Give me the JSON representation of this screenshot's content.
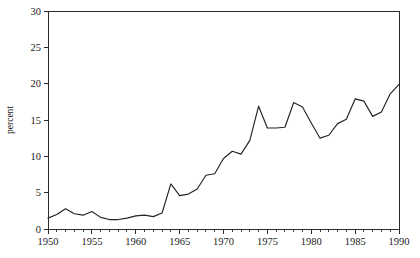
{
  "chart_data": {
    "type": "line",
    "title": "",
    "subtitle": "",
    "xlabel": "",
    "ylabel": "percent",
    "xlim": [
      1950,
      1990
    ],
    "ylim": [
      0,
      30
    ],
    "grid": false,
    "legend": null,
    "x_tick_labels": [
      "1950",
      "1955",
      "1960",
      "1965",
      "1970",
      "1975",
      "1980",
      "1985",
      "1990"
    ],
    "x_tick_values": [
      1950,
      1955,
      1960,
      1965,
      1970,
      1975,
      1980,
      1985,
      1990
    ],
    "x_minor_tick_step": 1,
    "y_tick_labels": [
      "0",
      "5",
      "10",
      "15",
      "20",
      "25",
      "30"
    ],
    "y_tick_values": [
      0,
      5,
      10,
      15,
      20,
      25,
      30
    ],
    "x": [
      1950,
      1951,
      1952,
      1953,
      1954,
      1955,
      1956,
      1957,
      1958,
      1959,
      1960,
      1961,
      1962,
      1963,
      1964,
      1965,
      1966,
      1967,
      1968,
      1969,
      1970,
      1971,
      1972,
      1973,
      1974,
      1975,
      1976,
      1977,
      1978,
      1979,
      1980,
      1981,
      1982,
      1983,
      1984,
      1985,
      1986,
      1987,
      1988,
      1989,
      1990
    ],
    "series": [
      {
        "name": "percent",
        "values": [
          1.5,
          2.0,
          2.8,
          2.1,
          1.9,
          2.4,
          1.6,
          1.3,
          1.3,
          1.5,
          1.8,
          1.9,
          1.7,
          2.2,
          6.2,
          4.6,
          4.8,
          5.5,
          7.4,
          7.6,
          9.7,
          10.7,
          10.3,
          12.2,
          16.9,
          13.9,
          13.9,
          14.0,
          17.4,
          16.8,
          14.6,
          12.5,
          12.9,
          14.5,
          15.1,
          17.9,
          17.6,
          15.5,
          16.1,
          18.6,
          19.9
        ]
      }
    ],
    "peak": {
      "year": 1984,
      "value": 26.5
    },
    "endpoint": {
      "year": 1990,
      "value": 17.8
    },
    "line_color": "#232323"
  },
  "plot": {
    "left_px": 48,
    "right_px": 399,
    "top_px": 11,
    "bottom_px": 229
  }
}
